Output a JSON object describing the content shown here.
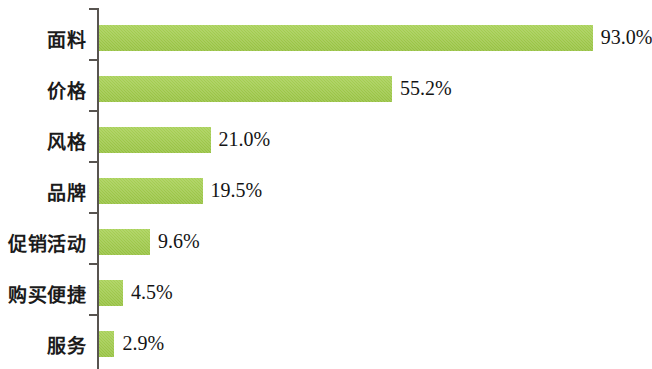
{
  "chart_data": {
    "type": "bar",
    "orientation": "horizontal",
    "title": "",
    "subtitle": "",
    "xlabel": "",
    "ylabel": "",
    "grid": false,
    "legend": null,
    "xlim": [
      0,
      100
    ],
    "bar_color": "#9ecb43",
    "axis_color": "#585450",
    "categories": [
      "面料",
      "价格",
      "风格",
      "品牌",
      "促销活动",
      "购买便捷",
      "服务"
    ],
    "values": [
      93.0,
      55.2,
      21.0,
      19.5,
      9.6,
      4.5,
      2.9
    ],
    "value_labels": [
      "93.0%",
      "55.2%",
      "21.0%",
      "19.5%",
      "9.6%",
      "4.5%",
      "2.9%"
    ],
    "rows": [
      {
        "category": "面料",
        "value": 93.0,
        "value_label": "93.0%"
      },
      {
        "category": "价格",
        "value": 55.2,
        "value_label": "55.2%"
      },
      {
        "category": "风格",
        "value": 21.0,
        "value_label": "21.0%"
      },
      {
        "category": "品牌",
        "value": 19.5,
        "value_label": "19.5%"
      },
      {
        "category": "促销活动",
        "value": 9.6,
        "value_label": "9.6%"
      },
      {
        "category": "购买便捷",
        "value": 4.5,
        "value_label": "4.5%"
      },
      {
        "category": "服务",
        "value": 2.9,
        "value_label": "2.9%"
      }
    ]
  }
}
